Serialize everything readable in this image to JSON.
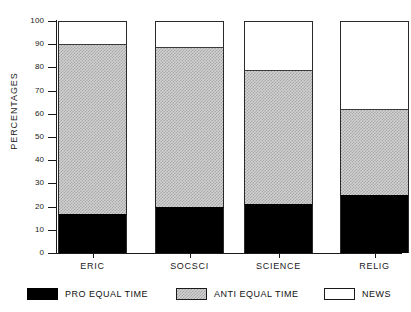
{
  "chart_data": {
    "type": "bar",
    "subtype": "stacked-vertical-100pct",
    "title": "",
    "xlabel": "",
    "ylabel": "PERCENTAGES",
    "ylim": [
      0,
      100
    ],
    "yticks": [
      0,
      10,
      20,
      30,
      40,
      50,
      60,
      70,
      80,
      90,
      100
    ],
    "grid": false,
    "legend_position": "bottom",
    "categories": [
      "ERIC",
      "SOCSCI",
      "SCIENCE",
      "RELIG"
    ],
    "series": [
      {
        "name": "PRO EQUAL TIME",
        "color": "#000000",
        "values": [
          17,
          20,
          21,
          25
        ]
      },
      {
        "name": "ANTI EQUAL TIME",
        "color": "#c8c8c8",
        "values": [
          73,
          69,
          58,
          37
        ]
      },
      {
        "name": "NEWS",
        "color": "#ffffff",
        "values": [
          10,
          11,
          21,
          38
        ]
      }
    ],
    "cumulative_tops": {
      "PRO EQUAL TIME": [
        17,
        20,
        21,
        25
      ],
      "ANTI EQUAL TIME": [
        90,
        89,
        79,
        62
      ],
      "NEWS": [
        100,
        100,
        100,
        100
      ]
    }
  },
  "axis": {
    "y_label": "PERCENTAGES",
    "y_tick_labels": [
      "0",
      "10",
      "20",
      "30",
      "40",
      "50",
      "60",
      "70",
      "80",
      "90",
      "100"
    ],
    "x_tick_labels": [
      "ERIC",
      "SOCSCI",
      "SCIENCE",
      "RELIG"
    ]
  },
  "legend": {
    "items": [
      {
        "label": "PRO EQUAL TIME",
        "swatch": "black-swatch"
      },
      {
        "label": "ANTI EQUAL TIME",
        "swatch": "gray-swatch"
      },
      {
        "label": "NEWS",
        "swatch": "white-swatch"
      }
    ]
  }
}
